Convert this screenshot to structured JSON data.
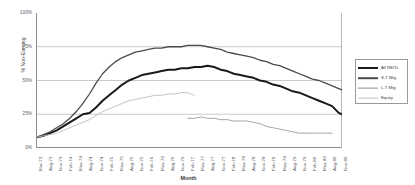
{
  "chart_data": {
    "type": "line",
    "title": "",
    "xlabel": "Month",
    "ylabel": "% Non-Earning",
    "ylim": [
      0,
      100
    ],
    "ytick_labels": [
      "0%",
      "25%",
      "50%",
      "75%",
      "100%"
    ],
    "ytick_values": [
      0,
      25,
      50,
      75,
      100
    ],
    "grid": true,
    "legend_position": "right",
    "categories": [
      "Mar-73",
      "Jun-73",
      "Sep-73",
      "Dec-73",
      "Mar-74",
      "Jun-74",
      "Sep-74",
      "Dec-74",
      "Mar-75",
      "Jun-75",
      "Sep-75",
      "Dec-75",
      "Mar-76",
      "Jun-76",
      "Sep-76",
      "Dec-76",
      "Mar-77",
      "Jun-77",
      "Sep-77",
      "Dec-77",
      "Mar-78",
      "Jun-78",
      "Sep-78",
      "Dec-78",
      "Mar-79",
      "Jun-79",
      "Sep-79",
      "Dec-79",
      "Mar-80",
      "Jun-80",
      "Sep-80",
      "Nov-80"
    ],
    "xtick_labels": [
      "Mar-73",
      "Aug-73",
      "Nov-73",
      "Feb-74",
      "May-74",
      "Aug-74",
      "Nov-74",
      "Feb-75",
      "May-75",
      "Aug-75",
      "Nov-75",
      "Feb-76",
      "May-76",
      "Aug-76",
      "Nov-76",
      "Feb-77",
      "May-77",
      "Aug-77",
      "Nov-77",
      "Feb-78",
      "May-78",
      "Aug-78",
      "Nov-78",
      "Feb-79",
      "May-79",
      "Aug-79",
      "Nov-79",
      "Feb-80",
      "May-80",
      "Aug-80",
      "Nov-80"
    ],
    "series": [
      {
        "name": "All REITs",
        "color": "#1a1a1a",
        "width": 2.0,
        "x": [
          0,
          2,
          4,
          6,
          8,
          10,
          12,
          14,
          16,
          18,
          20,
          22,
          24,
          26,
          28,
          30,
          32,
          34,
          36,
          38,
          40,
          42,
          44,
          46,
          48,
          50,
          52,
          54,
          56,
          58,
          60,
          62,
          64,
          66,
          68,
          70,
          72,
          74,
          76,
          78,
          80,
          82,
          84,
          86,
          88,
          90,
          92,
          93
        ],
        "y": [
          8,
          9,
          11,
          13,
          16,
          19,
          22,
          25,
          26,
          30,
          35,
          39,
          43,
          47,
          50,
          52,
          54,
          55,
          56,
          57,
          58,
          58,
          59,
          59,
          60,
          60,
          61,
          60,
          58,
          57,
          55,
          54,
          53,
          52,
          50,
          49,
          47,
          46,
          44,
          42,
          41,
          39,
          37,
          35,
          33,
          31,
          26,
          25
        ]
      },
      {
        "name": "S-T Mtg",
        "color": "#4a4a4a",
        "width": 1.3,
        "x": [
          0,
          2,
          4,
          6,
          8,
          10,
          12,
          14,
          16,
          18,
          20,
          22,
          24,
          26,
          28,
          30,
          32,
          34,
          36,
          38,
          40,
          42,
          44,
          46,
          48,
          50,
          52,
          54,
          56,
          58,
          60,
          62,
          64,
          66,
          68,
          70,
          72,
          74,
          76,
          78,
          80,
          82,
          84,
          86,
          88,
          90,
          92,
          93
        ],
        "y": [
          8,
          10,
          12,
          15,
          18,
          22,
          27,
          33,
          40,
          48,
          55,
          60,
          64,
          67,
          69,
          71,
          72,
          73,
          74,
          74,
          75,
          75,
          75,
          76,
          76,
          76,
          75,
          74,
          73,
          71,
          70,
          69,
          68,
          67,
          65,
          64,
          62,
          61,
          59,
          57,
          55,
          53,
          51,
          50,
          48,
          46,
          44,
          43
        ]
      },
      {
        "name": "L-T Mtg",
        "color": "#9b9b9b",
        "width": 0.9,
        "x": [
          46,
          48,
          50,
          52,
          54,
          56,
          58,
          60,
          62,
          64,
          66,
          68,
          70,
          72,
          74,
          76,
          78,
          80,
          82,
          84,
          86,
          88,
          90
        ],
        "y": [
          22,
          22,
          23,
          22,
          22,
          21,
          21,
          20,
          20,
          20,
          19,
          18,
          16,
          15,
          14,
          13,
          12,
          11,
          11,
          11,
          11,
          11,
          11
        ]
      },
      {
        "name": "Equity",
        "color": "#bdbdbd",
        "width": 0.9,
        "x": [
          0,
          2,
          4,
          6,
          8,
          10,
          12,
          14,
          16,
          18,
          20,
          22,
          24,
          26,
          28,
          30,
          32,
          34,
          36,
          38,
          40,
          42,
          44,
          46,
          48
        ],
        "y": [
          8,
          9,
          10,
          11,
          13,
          15,
          17,
          19,
          21,
          24,
          27,
          29,
          31,
          33,
          35,
          36,
          37,
          38,
          39,
          39,
          40,
          40,
          41,
          41,
          39
        ]
      }
    ],
    "legend": [
      {
        "label": "All REITs",
        "color": "#1a1a1a",
        "width": 2.0
      },
      {
        "label": "S-T Mtg",
        "color": "#4a4a4a",
        "width": 1.6
      },
      {
        "label": "L-T Mtg",
        "color": "#8f8f8f",
        "width": 0.8
      },
      {
        "label": "Equity",
        "color": "#c2c2c2",
        "width": 0.8
      }
    ]
  }
}
